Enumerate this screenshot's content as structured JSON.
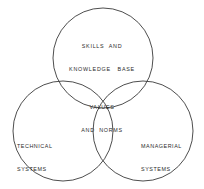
{
  "diagram": {
    "type": "venn-three-circle",
    "background_color": "#ffffff",
    "stroke_color": "#3a3a3a",
    "text_color": "#2b2b2b",
    "circles": [
      {
        "name": "skills-and-knowledge-base",
        "cx": 103,
        "cy": 58,
        "r": 50
      },
      {
        "name": "technical-systems",
        "cx": 63,
        "cy": 131,
        "r": 50
      },
      {
        "name": "managerial-systems",
        "cx": 143,
        "cy": 131,
        "r": 50
      }
    ],
    "labels": {
      "top": {
        "line1": "SKILLS  AND",
        "line2": "KNOWLEDGE   BASE"
      },
      "center": {
        "line1": "VALUES",
        "line2": "AND  NORMS"
      },
      "left": {
        "line1": "TECHNICAL",
        "line2": "SYSTEMS"
      },
      "right": {
        "line1": "MANAGERIAL",
        "line2": "SYSTEMS"
      }
    }
  }
}
